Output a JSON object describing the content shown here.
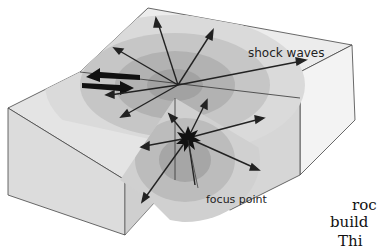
{
  "diagram": {
    "labels": {
      "shock_waves": "shock waves",
      "focus_point": "focus point"
    },
    "fault_motion_arrows": "opposing-arrows",
    "cut_off_body_text": [
      "roc",
      "build",
      "Thi"
    ],
    "colors": {
      "block_top": "#e6e6e6",
      "block_front": "#dadada",
      "wave_dark": "#9a9a9a",
      "wave_light": "#c8c8c8",
      "arrow": "#2a2a2a",
      "focus": "#111111"
    }
  }
}
